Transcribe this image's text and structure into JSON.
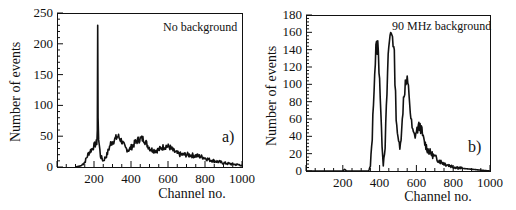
{
  "chart_data": [
    {
      "type": "line",
      "panel": "a",
      "title": "",
      "annotation": "No background",
      "panel_label": "a)",
      "xlabel": "Channel no.",
      "ylabel": "Number of events",
      "xlim": [
        0,
        1000
      ],
      "ylim": [
        0,
        250
      ],
      "xticks": [
        200,
        400,
        600,
        800,
        1000
      ],
      "yticks": [
        0,
        50,
        100,
        150,
        200,
        250
      ],
      "grid": false,
      "series": [
        {
          "name": "No background",
          "x": [
            100,
            130,
            150,
            170,
            190,
            200,
            210,
            215,
            218,
            220,
            222,
            225,
            235,
            250,
            270,
            290,
            310,
            330,
            350,
            370,
            390,
            410,
            430,
            450,
            470,
            490,
            510,
            530,
            550,
            570,
            590,
            610,
            630,
            650,
            670,
            700,
            730,
            760,
            790,
            820,
            850,
            880,
            910,
            940,
            970,
            1000
          ],
          "values": [
            0,
            2,
            8,
            22,
            30,
            34,
            38,
            40,
            60,
            230,
            80,
            45,
            18,
            10,
            20,
            38,
            44,
            50,
            42,
            30,
            28,
            35,
            42,
            46,
            45,
            35,
            28,
            27,
            28,
            32,
            34,
            32,
            26,
            22,
            20,
            20,
            19,
            18,
            16,
            12,
            10,
            8,
            6,
            5,
            4,
            3
          ]
        }
      ]
    },
    {
      "type": "line",
      "panel": "b",
      "title": "",
      "annotation": "90 MHz background",
      "panel_label": "b)",
      "xlabel": "Channel no.",
      "ylabel": "Number of events",
      "xlim": [
        0,
        1000
      ],
      "ylim": [
        0,
        180
      ],
      "xticks": [
        200,
        400,
        600,
        800,
        1000
      ],
      "yticks": [
        0,
        20,
        40,
        60,
        80,
        100,
        120,
        140,
        160,
        180
      ],
      "grid": false,
      "series": [
        {
          "name": "90 MHz background",
          "x": [
            0,
            200,
            210,
            220,
            340,
            350,
            360,
            370,
            380,
            390,
            400,
            410,
            420,
            430,
            440,
            450,
            460,
            470,
            480,
            490,
            500,
            510,
            520,
            530,
            540,
            550,
            560,
            570,
            580,
            590,
            600,
            610,
            620,
            630,
            640,
            660,
            680,
            700,
            730,
            760,
            800,
            850,
            900,
            950,
            1000
          ],
          "values": [
            0,
            0,
            2,
            0,
            0,
            5,
            40,
            100,
            140,
            145,
            110,
            45,
            8,
            30,
            90,
            145,
            158,
            160,
            130,
            65,
            35,
            30,
            45,
            85,
            100,
            102,
            90,
            60,
            45,
            40,
            45,
            50,
            52,
            45,
            35,
            25,
            20,
            16,
            11,
            8,
            5,
            3,
            2,
            1,
            0
          ]
        }
      ]
    }
  ],
  "panels": {
    "a": {
      "annotation": "No background",
      "panel_label": "a)",
      "xlabel": "Channel no.",
      "ylabel": "Number of events",
      "yticks": [
        "0",
        "50",
        "100",
        "150",
        "200",
        "250"
      ],
      "xticks": [
        "200",
        "400",
        "600",
        "800",
        "1000"
      ]
    },
    "b": {
      "annotation": "90 MHz background",
      "panel_label": "b)",
      "xlabel": "Channel no.",
      "ylabel": "Number of events",
      "yticks": [
        "0",
        "20",
        "40",
        "60",
        "80",
        "100",
        "120",
        "140",
        "160",
        "180"
      ],
      "xticks": [
        "200",
        "400",
        "600",
        "800",
        "1000"
      ]
    }
  },
  "colors": {
    "line": "#111111",
    "axis": "#111111",
    "background": "#ffffff"
  }
}
